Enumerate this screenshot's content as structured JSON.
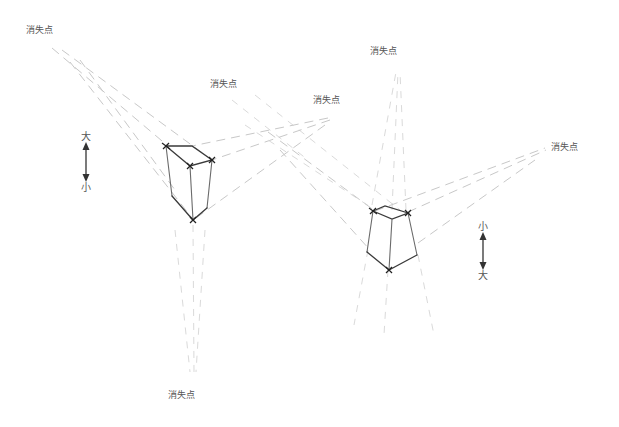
{
  "diagram": {
    "vanishing_point_label": "消失点",
    "left_figure": {
      "labels": {
        "vp_top_left": "消失点",
        "vp_top_middle": "消失点",
        "vp_top_right": "消失点",
        "vp_bottom": "消失点"
      },
      "size_indicator": {
        "top": "大",
        "bottom": "小"
      }
    },
    "right_figure": {
      "labels": {
        "vp_top": "消失点",
        "vp_right": "消失点"
      },
      "size_indicator": {
        "top": "小",
        "bottom": "大"
      }
    }
  },
  "colors": {
    "background": "#ffffff",
    "guide_lines": "#c8c8c8",
    "box_edges": "#555555",
    "text": "#555555"
  }
}
